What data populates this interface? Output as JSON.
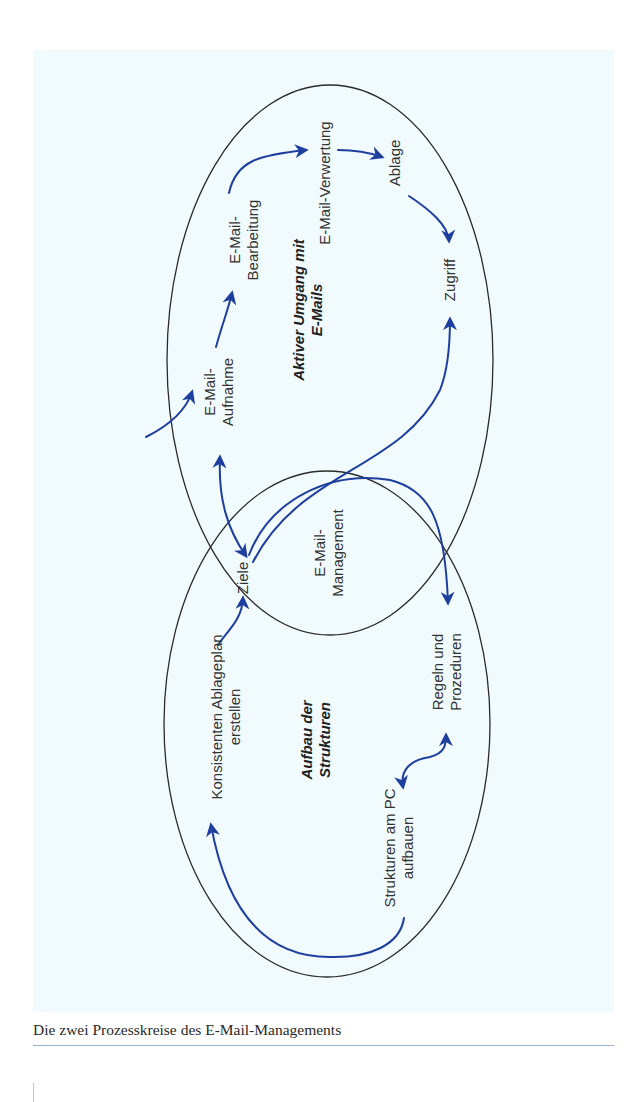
{
  "figure": {
    "caption": "Die zwei Prozesskreise des E-Mail-Managements",
    "colors": {
      "panel_background": "#f1fbfe",
      "arrow": "#1f3f9e",
      "outline": "#2b2b2b",
      "caption_rule": "#9fb3cf"
    },
    "circles": {
      "upper": {
        "title_line1": "Aktiver Umgang mit",
        "title_line2": "E-Mails"
      },
      "lower": {
        "title_line1": "Aufbau der",
        "title_line2": "Strukturen"
      },
      "overlap": {
        "label_line1": "E-Mail-",
        "label_line2": "Management"
      }
    },
    "nodes": {
      "ziele": "Ziele",
      "aufnahme_line1": "E-Mail-",
      "aufnahme_line2": "Aufnahme",
      "bearbeitung_line1": "E-Mail-",
      "bearbeitung_line2": "Bearbeitung",
      "verwertung": "E-Mail-Verwertung",
      "ablage": "Ablage",
      "zugriff": "Zugriff",
      "regeln_line1": "Regeln und",
      "regeln_line2": "Prozeduren",
      "strukturen_line1": "Strukturen am PC",
      "strukturen_line2": "aufbauen",
      "ablageplan_line1": "Konsistenten Ablageplan",
      "ablageplan_line2": "erstellen"
    }
  }
}
